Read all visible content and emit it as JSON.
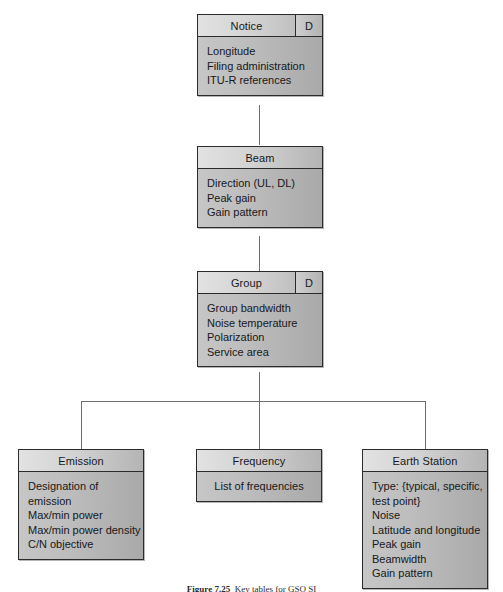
{
  "figure": {
    "caption_label": "Figure 7.25",
    "caption_text": "Key tables for GSO SI"
  },
  "diagram": {
    "type": "uml-class-hierarchy",
    "discriminator_marker": "D",
    "nodes": [
      {
        "id": "notice",
        "title": "Notice",
        "discriminator": "D",
        "attributes": "Longitude\nFiling administration\nITU-R references"
      },
      {
        "id": "beam",
        "title": "Beam",
        "discriminator": "",
        "attributes": "Direction (UL, DL)\nPeak gain\nGain pattern"
      },
      {
        "id": "group",
        "title": "Group",
        "discriminator": "D",
        "attributes": "Group bandwidth\nNoise temperature\nPolarization\nService area"
      },
      {
        "id": "emission",
        "title": "Emission",
        "discriminator": "",
        "attributes": "Designation of emission\nMax/min power\nMax/min power density\nC/N objective"
      },
      {
        "id": "frequency",
        "title": "Frequency",
        "discriminator": "",
        "attributes": "List of frequencies"
      },
      {
        "id": "earth_station",
        "title": "Earth Station",
        "discriminator": "",
        "attributes": "Type: {typical, specific,\ntest point}\nNoise\nLatitude and longitude\nPeak gain\nBeamwidth\nGain pattern"
      }
    ],
    "relationships": [
      {
        "from": "beam",
        "to": "notice",
        "kind": "generalization"
      },
      {
        "from": "group",
        "to": "beam",
        "kind": "generalization"
      },
      {
        "from": "emission",
        "to": "group",
        "kind": "generalization"
      },
      {
        "from": "frequency",
        "to": "group",
        "kind": "generalization"
      },
      {
        "from": "earth_station",
        "to": "group",
        "kind": "generalization"
      }
    ],
    "colors": {
      "box_fill": "#b9b9b9",
      "header_fill": "#d6d6d6",
      "border": "#2b2b2b",
      "connector": "#6e6e6e",
      "text": "#17181a",
      "background": "#ffffff"
    }
  }
}
